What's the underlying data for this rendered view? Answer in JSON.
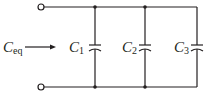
{
  "diagram": {
    "type": "parallel-capacitor-circuit",
    "equivalent_label": {
      "main": "C",
      "sub": "eq"
    },
    "capacitors": [
      {
        "id": "C1",
        "main": "C",
        "sub": "1",
        "x": 95
      },
      {
        "id": "C2",
        "main": "C",
        "sub": "2",
        "x": 145
      },
      {
        "id": "C3",
        "main": "C",
        "sub": "3",
        "x": 197
      }
    ],
    "colors": {
      "wire": "#231f20",
      "background": "#ffffff"
    }
  }
}
